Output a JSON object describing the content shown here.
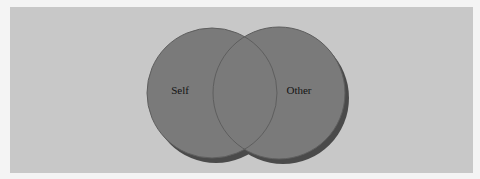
{
  "diagram": {
    "type": "venn",
    "sets": [
      {
        "label": "Self",
        "cx": 212,
        "cy": 93,
        "r": 65
      },
      {
        "label": "Other",
        "cx": 279,
        "cy": 93,
        "r": 66
      }
    ],
    "colors": {
      "panel": "#c8c8c8",
      "circle_fill": "#7a7a7a",
      "circle_stroke": "#5e5e5e",
      "shadow": "#4a4a4a",
      "text": "#141414"
    }
  }
}
